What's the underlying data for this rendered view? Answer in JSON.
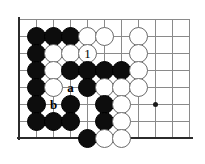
{
  "figure": {
    "kind": "go-board-diagram",
    "board": {
      "columns": 11,
      "rows": 8,
      "origin_x": 19,
      "origin_y": 19,
      "spacing": 17,
      "grid_color": "#8a8a8a",
      "edge_color": "#2b2b2b",
      "background": "#ffffff",
      "left_edge": true,
      "bottom_edge": true,
      "top_edge_is_grid": true
    },
    "star_points": [
      {
        "name": "hoshi-right",
        "col": 8,
        "row": 5
      }
    ],
    "stone_colors": {
      "black": "#0d0d0d",
      "white": "#ffffff",
      "white_outline": "#6b6b6b",
      "black_outline": "#000000"
    },
    "stones": [
      {
        "id": "b-c1r1",
        "color": "black",
        "col": 1,
        "row": 1,
        "label": ""
      },
      {
        "id": "b-c2r1",
        "color": "black",
        "col": 2,
        "row": 1,
        "label": ""
      },
      {
        "id": "b-c3r1",
        "color": "black",
        "col": 3,
        "row": 1,
        "label": ""
      },
      {
        "id": "w-c4r1",
        "color": "white",
        "col": 4,
        "row": 1,
        "label": ""
      },
      {
        "id": "w-c5r1",
        "color": "white",
        "col": 5,
        "row": 1,
        "label": ""
      },
      {
        "id": "w-c7r1",
        "color": "white",
        "col": 7,
        "row": 1,
        "label": ""
      },
      {
        "id": "b-c1r2",
        "color": "black",
        "col": 1,
        "row": 2,
        "label": ""
      },
      {
        "id": "w-c2r2",
        "color": "white",
        "col": 2,
        "row": 2,
        "label": ""
      },
      {
        "id": "w-c3r2",
        "color": "white",
        "col": 3,
        "row": 2,
        "label": ""
      },
      {
        "id": "w-c4r2",
        "color": "white",
        "col": 4,
        "row": 2,
        "label": "1"
      },
      {
        "id": "w-c7r2",
        "color": "white",
        "col": 7,
        "row": 2,
        "label": ""
      },
      {
        "id": "b-c1r3",
        "color": "black",
        "col": 1,
        "row": 3,
        "label": ""
      },
      {
        "id": "w-c2r3",
        "color": "white",
        "col": 2,
        "row": 3,
        "label": ""
      },
      {
        "id": "b-c3r3",
        "color": "black",
        "col": 3,
        "row": 3,
        "label": ""
      },
      {
        "id": "b-c4r3",
        "color": "black",
        "col": 4,
        "row": 3,
        "label": ""
      },
      {
        "id": "b-c5r3",
        "color": "black",
        "col": 5,
        "row": 3,
        "label": ""
      },
      {
        "id": "b-c6r3",
        "color": "black",
        "col": 6,
        "row": 3,
        "label": ""
      },
      {
        "id": "w-c7r3",
        "color": "white",
        "col": 7,
        "row": 3,
        "label": ""
      },
      {
        "id": "b-c1r4",
        "color": "black",
        "col": 1,
        "row": 4,
        "label": ""
      },
      {
        "id": "w-c2r4",
        "color": "white",
        "col": 2,
        "row": 4,
        "label": ""
      },
      {
        "id": "b-c4r4",
        "color": "black",
        "col": 4,
        "row": 4,
        "label": ""
      },
      {
        "id": "w-c5r4",
        "color": "white",
        "col": 5,
        "row": 4,
        "label": ""
      },
      {
        "id": "w-c6r4",
        "color": "white",
        "col": 6,
        "row": 4,
        "label": ""
      },
      {
        "id": "w-c7r4",
        "color": "white",
        "col": 7,
        "row": 4,
        "label": ""
      },
      {
        "id": "b-c1r5",
        "color": "black",
        "col": 1,
        "row": 5,
        "label": ""
      },
      {
        "id": "b-c3r5",
        "color": "black",
        "col": 3,
        "row": 5,
        "label": ""
      },
      {
        "id": "b-c5r5",
        "color": "black",
        "col": 5,
        "row": 5,
        "label": ""
      },
      {
        "id": "w-c6r5",
        "color": "white",
        "col": 6,
        "row": 5,
        "label": ""
      },
      {
        "id": "b-c1r6",
        "color": "black",
        "col": 1,
        "row": 6,
        "label": ""
      },
      {
        "id": "b-c2r6",
        "color": "black",
        "col": 2,
        "row": 6,
        "label": ""
      },
      {
        "id": "b-c3r6",
        "color": "black",
        "col": 3,
        "row": 6,
        "label": ""
      },
      {
        "id": "b-c5r6",
        "color": "black",
        "col": 5,
        "row": 6,
        "label": ""
      },
      {
        "id": "w-c6r6",
        "color": "white",
        "col": 6,
        "row": 6,
        "label": ""
      },
      {
        "id": "b-c4r7",
        "color": "black",
        "col": 4,
        "row": 7,
        "label": ""
      },
      {
        "id": "w-c5r7",
        "color": "white",
        "col": 5,
        "row": 7,
        "label": ""
      },
      {
        "id": "w-c6r7",
        "color": "white",
        "col": 6,
        "row": 7,
        "label": ""
      }
    ],
    "point_labels": [
      {
        "id": "label-a",
        "text": "a",
        "col": 3,
        "row": 4
      },
      {
        "id": "label-b",
        "text": "b",
        "col": 2,
        "row": 5
      }
    ]
  }
}
